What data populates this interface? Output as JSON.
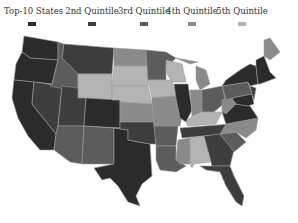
{
  "legend": {
    "items": [
      {
        "label": "Top-10 States",
        "color": "#2b2b2b"
      },
      {
        "label": "2nd Quintile",
        "color": "#3d3d3d"
      },
      {
        "label": "3rd Quintile",
        "color": "#5c5c5c"
      },
      {
        "label": "4th Quintile",
        "color": "#8a8a8a"
      },
      {
        "label": "5th Quintile",
        "color": "#b4b4b4"
      }
    ]
  },
  "map": {
    "title": "US states shaded by quintile",
    "regions": [
      {
        "name": "Washington",
        "quintile": "Top-10"
      },
      {
        "name": "Oregon",
        "quintile": "Top-10"
      },
      {
        "name": "California",
        "quintile": "Top-10"
      },
      {
        "name": "Nevada",
        "quintile": "2nd"
      },
      {
        "name": "Idaho",
        "quintile": "3rd"
      },
      {
        "name": "Montana",
        "quintile": "2nd"
      },
      {
        "name": "Wyoming",
        "quintile": "5th"
      },
      {
        "name": "Utah",
        "quintile": "2nd"
      },
      {
        "name": "Colorado",
        "quintile": "Top-10"
      },
      {
        "name": "Arizona",
        "quintile": "3rd"
      },
      {
        "name": "New Mexico",
        "quintile": "3rd"
      },
      {
        "name": "Texas",
        "quintile": "Top-10"
      },
      {
        "name": "North Dakota",
        "quintile": "4th"
      },
      {
        "name": "South Dakota",
        "quintile": "5th"
      },
      {
        "name": "Nebraska",
        "quintile": "5th"
      },
      {
        "name": "Kansas",
        "quintile": "4th"
      },
      {
        "name": "Oklahoma",
        "quintile": "2nd"
      },
      {
        "name": "Minnesota",
        "quintile": "3rd"
      },
      {
        "name": "Iowa",
        "quintile": "5th"
      },
      {
        "name": "Missouri",
        "quintile": "4th"
      },
      {
        "name": "Arkansas",
        "quintile": "3rd"
      },
      {
        "name": "Louisiana",
        "quintile": "3rd"
      },
      {
        "name": "Wisconsin",
        "quintile": "5th"
      },
      {
        "name": "Illinois",
        "quintile": "Top-10"
      },
      {
        "name": "Michigan",
        "quintile": "4th"
      },
      {
        "name": "Indiana",
        "quintile": "4th"
      },
      {
        "name": "Ohio",
        "quintile": "3rd"
      },
      {
        "name": "Kentucky",
        "quintile": "5th"
      },
      {
        "name": "Tennessee",
        "quintile": "2nd"
      },
      {
        "name": "Mississippi",
        "quintile": "4th"
      },
      {
        "name": "Alabama",
        "quintile": "5th"
      },
      {
        "name": "Georgia",
        "quintile": "2nd"
      },
      {
        "name": "Florida",
        "quintile": "2nd"
      },
      {
        "name": "South Carolina",
        "quintile": "3rd"
      },
      {
        "name": "North Carolina",
        "quintile": "4th"
      },
      {
        "name": "Virginia",
        "quintile": "Top-10"
      },
      {
        "name": "West Virginia",
        "quintile": "4th"
      },
      {
        "name": "Pennsylvania",
        "quintile": "3rd"
      },
      {
        "name": "New York",
        "quintile": "Top-10"
      },
      {
        "name": "Maine",
        "quintile": "4th"
      },
      {
        "name": "New England",
        "quintile": "Top-10"
      },
      {
        "name": "Maryland",
        "quintile": "Top-10"
      }
    ]
  }
}
